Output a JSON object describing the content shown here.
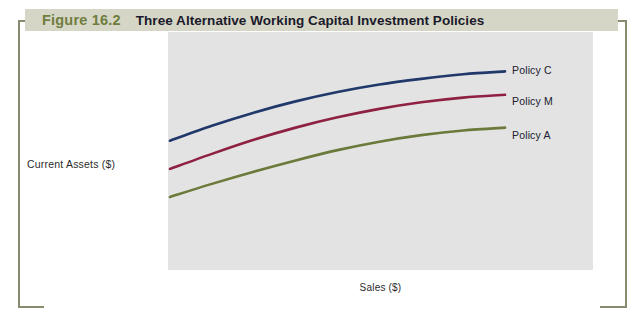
{
  "figure": {
    "number": "Figure 16.2",
    "title": "Three Alternative Working Capital Investment Policies",
    "band_color": "#d6d6c6",
    "number_color": "#6f7d3e",
    "title_color": "#1a1a2b",
    "bracket_color": "#8a8b6c",
    "panel_color": "#e3e3e3"
  },
  "chart_data": {
    "type": "line",
    "title": "Three Alternative Working Capital Investment Policies",
    "xlabel": "Sales ($)",
    "ylabel": "Current Assets ($)",
    "grid": false,
    "legend_position": "right-inline",
    "axis_tick_labels": {
      "x": [],
      "y": []
    },
    "xlim": [
      0,
      100
    ],
    "ylim": [
      0,
      100
    ],
    "series": [
      {
        "name": "Policy C",
        "color": "#21386b",
        "description": "Relaxed (conservative) working capital investment policy - highest current assets for any level of sales",
        "x": [
          0,
          12.5,
          25,
          37.5,
          50,
          62.5,
          75,
          87.5,
          100
        ],
        "y": [
          58,
          66,
          73,
          79,
          84,
          88,
          91,
          93.5,
          95
        ]
      },
      {
        "name": "Policy M",
        "color": "#8e2142",
        "description": "Moderate working capital investment policy - intermediate level of current assets",
        "x": [
          0,
          12.5,
          25,
          37.5,
          50,
          62.5,
          75,
          87.5,
          100
        ],
        "y": [
          43,
          51,
          58.5,
          65,
          70.5,
          75,
          78.5,
          81,
          82.5
        ]
      },
      {
        "name": "Policy A",
        "color": "#6b7a3a",
        "description": "Restricted (aggressive) working capital investment policy - lowest current assets for any level of sales",
        "x": [
          0,
          12.5,
          25,
          37.5,
          50,
          62.5,
          75,
          87.5,
          100
        ],
        "y": [
          28,
          35,
          41.5,
          47.5,
          53,
          57.5,
          61,
          63.5,
          65
        ]
      }
    ]
  }
}
